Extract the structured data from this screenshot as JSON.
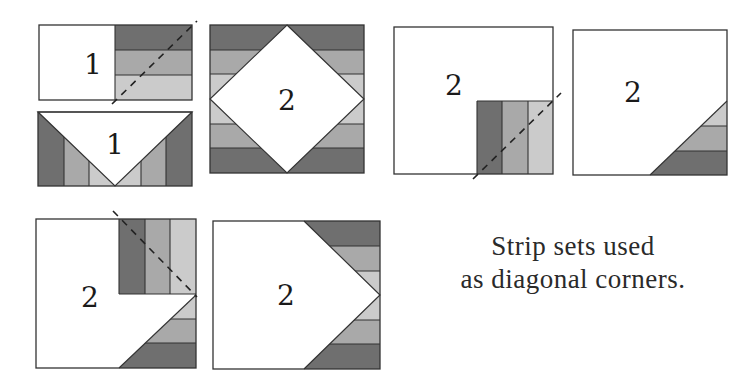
{
  "colors": {
    "dark": "#6f6f6f",
    "medium": "#a9a9a9",
    "light": "#cbcbcb",
    "white": "#ffffff",
    "line": "#333333"
  },
  "units": [
    {
      "id": "unit-1a",
      "label": "1",
      "description": "Rectangle unit 1 with horizontal 3-strip set on right half, dashed diagonal sewing line"
    },
    {
      "id": "unit-1b",
      "label": "1",
      "description": "Unit 1 result: white V-shaped triangle with strip sets at both diagonal corners"
    },
    {
      "id": "unit-2-diamond",
      "label": "2",
      "description": "Square unit 2 as white diamond with horizontal strip sets on all four corners"
    },
    {
      "id": "unit-2a",
      "label": "2",
      "description": "Square unit 2 with vertical 3-strip set in lower-right corner, dashed diagonal"
    },
    {
      "id": "unit-2b",
      "label": "2",
      "description": "Square unit 2 with strip-set triangle in lower-right corner"
    },
    {
      "id": "unit-2c",
      "label": "2",
      "description": "Square unit 2 with corner triangle plus vertical strip set at upper right, dashed diagonal"
    },
    {
      "id": "unit-2d",
      "label": "2",
      "description": "Square unit 2 with strip-set triangles on both right corners forming arrow point"
    }
  ],
  "caption": {
    "line1": "Strip sets used",
    "line2": "as diagonal corners."
  }
}
